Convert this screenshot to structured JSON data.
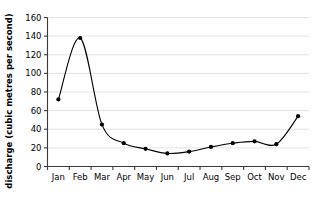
{
  "chart_data": {
    "type": "line",
    "title": "",
    "xlabel": "",
    "ylabel": "discharge (cubic metres per second)",
    "categories": [
      "Jan",
      "Feb",
      "Mar",
      "Apr",
      "May",
      "Jun",
      "Jul",
      "Aug",
      "Sep",
      "Oct",
      "Nov",
      "Dec"
    ],
    "values": [
      72,
      138,
      45,
      25,
      19,
      14,
      16,
      21,
      25,
      27,
      24,
      54
    ],
    "series": [
      {
        "name": "discharge",
        "values": [
          72,
          138,
          45,
          25,
          19,
          14,
          16,
          21,
          25,
          27,
          24,
          54
        ]
      }
    ],
    "ylim": [
      0,
      160
    ],
    "yticks": [
      0,
      20,
      40,
      60,
      80,
      100,
      120,
      140,
      160
    ],
    "ytick_labels": [
      "0",
      "20",
      "40",
      "60",
      "80",
      "100",
      "120",
      "140",
      "160"
    ],
    "grid": true,
    "grid_axis": "y",
    "legend": false,
    "legend_position": "none",
    "marker": "filled-circle",
    "line_style": "smooth",
    "colors": {
      "line": "#000000",
      "marker": "#000000",
      "grid": "#e3e3e3",
      "axis": "#3a3a3a",
      "background": "#ffffff"
    }
  }
}
